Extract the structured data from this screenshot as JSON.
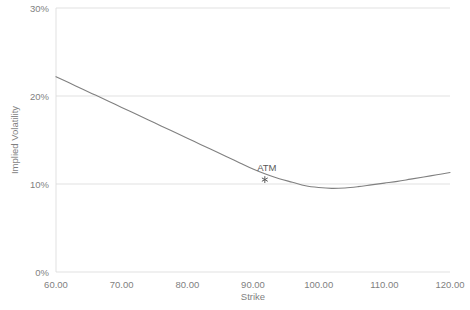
{
  "chart_data": {
    "type": "line",
    "title": "",
    "xlabel": "Strike",
    "ylabel": "Implied Volatility",
    "xlim": [
      60,
      120
    ],
    "ylim": [
      0,
      30
    ],
    "grid": true,
    "legend": "none",
    "y_tick_labels": [
      "0%",
      "10%",
      "20%",
      "30%"
    ],
    "y_tick_values": [
      0,
      10,
      20,
      30
    ],
    "x_tick_labels": [
      "60.00",
      "70.00",
      "80.00",
      "90.00",
      "100.00",
      "110.00",
      "120.00"
    ],
    "x_tick_values": [
      60,
      70,
      80,
      90,
      100,
      110,
      120
    ],
    "series": [
      {
        "name": "Implied Volatility",
        "color": "#808080",
        "x": [
          60,
          62,
          64,
          66,
          68,
          70,
          72,
          74,
          76,
          78,
          80,
          82,
          84,
          86,
          88,
          90,
          92,
          94,
          96,
          98,
          100,
          102,
          104,
          106,
          108,
          110,
          112,
          114,
          116,
          118,
          120
        ],
        "values": [
          22.2,
          21.5,
          20.8,
          20.1,
          19.4,
          18.7,
          18.0,
          17.3,
          16.6,
          15.9,
          15.2,
          14.5,
          13.8,
          13.1,
          12.4,
          11.7,
          11.1,
          10.6,
          10.2,
          9.8,
          9.6,
          9.5,
          9.55,
          9.7,
          9.9,
          10.1,
          10.3,
          10.55,
          10.8,
          11.05,
          11.3
        ]
      }
    ],
    "annotations": [
      {
        "label": "ATM",
        "x": 91.8,
        "y": 10.5,
        "marker": "asterisk",
        "marker_color": "#595959",
        "label_color": "#595959"
      }
    ]
  }
}
